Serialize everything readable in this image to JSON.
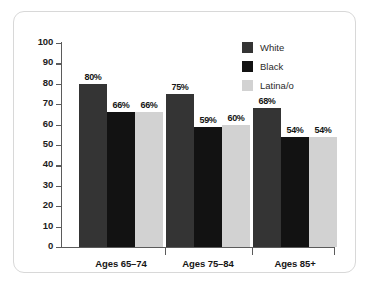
{
  "chart_data": {
    "type": "bar",
    "title": "",
    "subtitle": "",
    "xlabel": "",
    "ylabel": "",
    "ylim": [
      0,
      100
    ],
    "yticks": [
      0,
      10,
      20,
      30,
      40,
      50,
      60,
      70,
      80,
      90,
      100
    ],
    "ytick_labels": [
      "0",
      "10",
      "20",
      "30",
      "40",
      "50",
      "60",
      "70",
      "80",
      "90",
      "100"
    ],
    "grid": false,
    "legend_position": "top-right",
    "value_suffix": "%",
    "categories": [
      "Ages 65–74",
      "Ages 75–84",
      "Ages 85+"
    ],
    "series": [
      {
        "name": "White",
        "color": "#343434",
        "values": [
          80,
          75,
          68
        ],
        "labels": [
          "80%",
          "75%",
          "68%"
        ]
      },
      {
        "name": "Black",
        "color": "#121212",
        "values": [
          66,
          59,
          54
        ],
        "labels": [
          "66%",
          "59%",
          "54%"
        ]
      },
      {
        "name": "Latina/o",
        "color": "#d2d2d2",
        "values": [
          66,
          60,
          54
        ],
        "labels": [
          "66%",
          "60%",
          "54%"
        ]
      }
    ]
  },
  "legend": {
    "items": [
      {
        "label": "White",
        "color": "#343434"
      },
      {
        "label": "Black",
        "color": "#121212"
      },
      {
        "label": "Latina/o",
        "color": "#d2d2d2"
      }
    ]
  },
  "axis": {
    "y": {
      "labels": [
        "100",
        "90",
        "80",
        "70",
        "60",
        "50",
        "40",
        "30",
        "20",
        "10",
        "0"
      ]
    },
    "x": {
      "labels": [
        "Ages 65–74",
        "Ages 75–84",
        "Ages 85+"
      ]
    }
  },
  "colors": {
    "frame_border": "#d8d8d8",
    "axis": "#5b5b5b",
    "text": "#161616",
    "background": "#ffffff"
  }
}
